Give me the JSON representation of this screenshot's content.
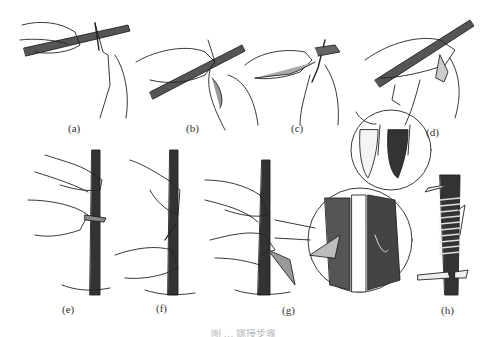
{
  "figure": {
    "caption": "图 … 嫁接步骤",
    "panels": [
      {
        "id": "a",
        "label": "(a)",
        "description": "Holding scion stick, knife cutting upward"
      },
      {
        "id": "b",
        "label": "(b)",
        "description": "Cutting bud shield from scion"
      },
      {
        "id": "c",
        "label": "(c)",
        "description": "Removing bud with knife"
      },
      {
        "id": "d",
        "label": "(d)",
        "description": "Detaching bud; inset shows bud shield front and back"
      },
      {
        "id": "e",
        "label": "(e)",
        "description": "T-cut on rootstock trunk"
      },
      {
        "id": "f",
        "label": "(f)",
        "description": "Opening bark flaps"
      },
      {
        "id": "g",
        "label": "(g)",
        "description": "Inserting bud into T-cut; inset magnified"
      },
      {
        "id": "h",
        "label": "(h)",
        "description": "Wrapping with tie"
      }
    ]
  },
  "colors": {
    "ink": "#222222",
    "background": "#ffffff",
    "bark": "#3a3a3a"
  }
}
